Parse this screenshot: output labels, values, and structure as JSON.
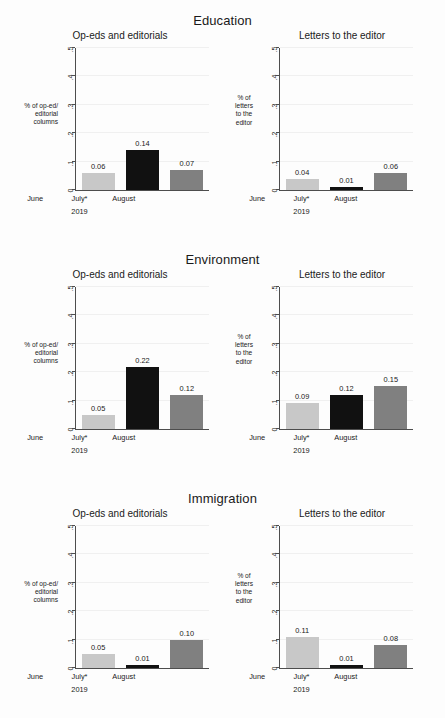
{
  "chart_data": {
    "type": "bar",
    "categories": [
      "June",
      "July*",
      "August"
    ],
    "x_axis_caption": "2019",
    "xlabel": "",
    "ylim": [
      0,
      0.5
    ],
    "ytick_labels": [
      "0",
      ".1",
      ".2",
      ".3",
      ".4",
      ".5"
    ],
    "ytick_values": [
      0,
      0.1,
      0.2,
      0.3,
      0.4,
      0.5
    ],
    "grid": true,
    "legend": "none",
    "series_colors": {
      "June": "#c8c8c8",
      "July*": "#111111",
      "August": "#808080"
    },
    "panels": [
      {
        "section": "Education",
        "subplots": [
          {
            "title": "Op-eds and editorials",
            "ylabel": "% of op-ed/\neditorial\ncolumns",
            "ylabel_lines": [
              "% of op-ed/",
              "editorial",
              "columns"
            ],
            "categories": [
              "June",
              "July*",
              "August"
            ],
            "values": [
              0.06,
              0.14,
              0.07
            ],
            "value_labels": [
              "0.06",
              "0.14",
              "0.07"
            ]
          },
          {
            "title": "Letters to the editor",
            "ylabel": "% of\nletters\nto the\neditor",
            "ylabel_lines": [
              "% of",
              "letters",
              "to the",
              "editor"
            ],
            "categories": [
              "June",
              "July*",
              "August"
            ],
            "values": [
              0.04,
              0.01,
              0.06
            ],
            "value_labels": [
              "0.04",
              "0.01",
              "0.06"
            ]
          }
        ]
      },
      {
        "section": "Environment",
        "subplots": [
          {
            "title": "Op-eds and editorials",
            "ylabel": "% of op-ed/\neditorial\ncolumns",
            "ylabel_lines": [
              "% of op-ed/",
              "editorial",
              "columns"
            ],
            "categories": [
              "June",
              "July*",
              "August"
            ],
            "values": [
              0.05,
              0.22,
              0.12
            ],
            "value_labels": [
              "0.05",
              "0.22",
              "0.12"
            ]
          },
          {
            "title": "Letters to the editor",
            "ylabel": "% of\nletters\nto the\neditor",
            "ylabel_lines": [
              "% of",
              "letters",
              "to the",
              "editor"
            ],
            "categories": [
              "June",
              "July*",
              "August"
            ],
            "values": [
              0.09,
              0.12,
              0.15
            ],
            "value_labels": [
              "0.09",
              "0.12",
              "0.15"
            ]
          }
        ]
      },
      {
        "section": "Immigration",
        "subplots": [
          {
            "title": "Op-eds and editorials",
            "ylabel": "% of op-ed/\neditorial\ncolumns",
            "ylabel_lines": [
              "% of op-ed/",
              "editorial",
              "columns"
            ],
            "categories": [
              "June",
              "July*",
              "August"
            ],
            "values": [
              0.05,
              0.01,
              0.1
            ],
            "value_labels": [
              "0.05",
              "0.01",
              "0.10"
            ]
          },
          {
            "title": "Letters to the editor",
            "ylabel": "% of\nletters\nto the\neditor",
            "ylabel_lines": [
              "% of",
              "letters",
              "to the",
              "editor"
            ],
            "categories": [
              "June",
              "July*",
              "August"
            ],
            "values": [
              0.11,
              0.01,
              0.08
            ],
            "value_labels": [
              "0.11",
              "0.01",
              "0.08"
            ]
          }
        ]
      }
    ]
  }
}
